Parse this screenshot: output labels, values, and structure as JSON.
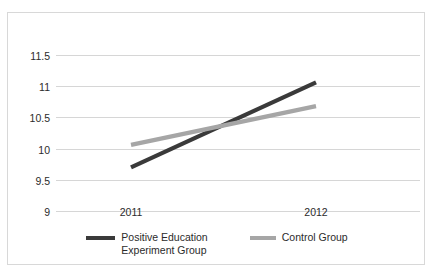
{
  "chart_data": {
    "type": "line",
    "title": "",
    "subtitle": "",
    "xlabel": "",
    "ylabel": "",
    "categories": [
      "2011",
      "2012"
    ],
    "x": [
      2011,
      2012
    ],
    "ylim": [
      9,
      11.5
    ],
    "yticks": [
      11.5,
      11,
      10.5,
      10,
      9.5,
      9
    ],
    "ytick_labels": [
      "11.5",
      "11",
      "10.5",
      "10",
      "9.5",
      "9"
    ],
    "grid": true,
    "legend_position": "bottom",
    "series": [
      {
        "name": "Positive Education\nExperiment Group",
        "name_line1": "Positive Education",
        "name_line2": "Experiment Group",
        "color": "#3a3a3a",
        "values": [
          9.7,
          11.06
        ]
      },
      {
        "name": "Control Group",
        "name_line1": "Control Group",
        "name_line2": "",
        "color": "#a6a6a6",
        "values": [
          10.06,
          10.68
        ]
      }
    ],
    "annotations": []
  },
  "axis": {
    "y_labels": [
      "11.5",
      "11",
      "10.5",
      "10",
      "9.5",
      "9"
    ],
    "x_labels": [
      "2011",
      "2012"
    ]
  },
  "legend": {
    "entries": [
      {
        "label_line1": "Positive Education",
        "label_line2": "Experiment Group",
        "swatch": "line-swatch-dark"
      },
      {
        "label_line1": "Control Group",
        "label_line2": "",
        "swatch": "line-swatch-gray"
      }
    ]
  },
  "colors": {
    "series_dark": "#3a3a3a",
    "series_gray": "#a6a6a6",
    "gridline": "#d6d6d6",
    "frame": "#d8d8d8",
    "text": "#2b2b2b",
    "background": "#ffffff"
  }
}
